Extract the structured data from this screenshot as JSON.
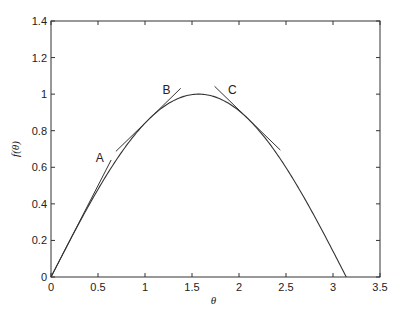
{
  "chart_data": {
    "type": "line",
    "title": "",
    "xlabel": "θ",
    "ylabel": "f(θ)",
    "xlim": [
      0,
      3.5
    ],
    "ylim": [
      0,
      1.4
    ],
    "xticks": [
      0,
      0.5,
      1,
      1.5,
      2,
      2.5,
      3,
      3.5
    ],
    "xtick_labels": [
      "0",
      "0.5",
      "1",
      "1.5",
      "2",
      "2.5",
      "3",
      "3.5"
    ],
    "yticks": [
      0,
      0.2,
      0.4,
      0.6,
      0.8,
      1,
      1.2,
      1.4
    ],
    "ytick_labels": [
      "0",
      "0.2",
      "0.4",
      "0.6",
      "0.8",
      "1",
      "1.2",
      "1.4"
    ],
    "grid": false,
    "legend": null,
    "series": [
      {
        "name": "f(θ) = sin(θ)",
        "x": [
          0,
          0.2,
          0.4,
          0.6,
          0.8,
          1.0,
          1.2,
          1.4,
          1.5708,
          1.8,
          2.0,
          2.2,
          2.4,
          2.6,
          2.8,
          3.0,
          3.1416
        ],
        "y": [
          0,
          0.199,
          0.389,
          0.565,
          0.717,
          0.841,
          0.932,
          0.985,
          1.0,
          0.974,
          0.909,
          0.808,
          0.675,
          0.516,
          0.335,
          0.141,
          0
        ]
      }
    ],
    "tangents": [
      {
        "label": "A",
        "at_theta": 0,
        "slope": 1.0,
        "x": [
          0,
          0.64
        ],
        "y": [
          0,
          0.64
        ]
      },
      {
        "label": "B",
        "at_theta": 1.047,
        "slope": 0.5,
        "x": [
          0.69,
          1.38
        ],
        "y": [
          0.687,
          1.032
        ]
      },
      {
        "label": "C",
        "at_theta": 2.094,
        "slope": -0.5,
        "x": [
          1.74,
          2.44
        ],
        "y": [
          1.043,
          0.694
        ]
      }
    ],
    "annotations": [
      {
        "text": "A",
        "x": 0.52,
        "y": 0.63
      },
      {
        "text": "B",
        "x": 1.23,
        "y": 1.0
      },
      {
        "text": "C",
        "x": 1.93,
        "y": 1.0
      }
    ]
  }
}
